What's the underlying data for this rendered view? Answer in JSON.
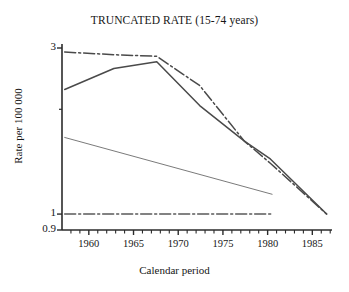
{
  "chart_data": {
    "type": "line",
    "title": "TRUNCATED RATE (15-74 years)",
    "xlabel": "Calendar period",
    "ylabel": "Rate per 100 000",
    "yscale": "log",
    "ylim": [
      0.9,
      3.0
    ],
    "xlim": [
      1957.0,
      1987.2
    ],
    "grid": false,
    "legend": "none",
    "ytick_labels": [
      "3",
      "1",
      "0.9"
    ],
    "ytick_values": [
      3,
      1,
      0.9
    ],
    "yminor_tick_values": [
      2
    ],
    "xtick_labels": [
      "1960",
      "1965",
      "1970",
      "1975",
      "1980",
      "1985"
    ],
    "xtick_values": [
      1960,
      1965,
      1970,
      1975,
      1980,
      1985
    ],
    "series": [
      {
        "name": "upper-dashdot-curve",
        "style": "dash-dot",
        "color": "#4a4a4a",
        "x": [
          1957.3,
          1962.8,
          1967.6,
          1972.4,
          1977.4,
          1980.3,
          1986.6
        ],
        "y": [
          2.92,
          2.87,
          2.84,
          2.34,
          1.62,
          1.4,
          1.0
        ]
      },
      {
        "name": "solid-peak-curve",
        "style": "solid",
        "color": "#4a4a4a",
        "x": [
          1957.3,
          1962.8,
          1967.6,
          1972.4,
          1977.4,
          1980.3,
          1986.6
        ],
        "y": [
          2.28,
          2.62,
          2.74,
          2.05,
          1.62,
          1.44,
          1.0
        ]
      },
      {
        "name": "thin-declining-line",
        "style": "thin-solid",
        "color": "#6b6b6b",
        "x": [
          1957.3,
          1980.5
        ],
        "y": [
          1.66,
          1.14
        ]
      },
      {
        "name": "baseline-dashdot",
        "style": "dash-dot",
        "color": "#5a5a5a",
        "x": [
          1957.3,
          1980.4
        ],
        "y": [
          1.0,
          1.0
        ]
      }
    ]
  },
  "axes": {
    "axis_color": "#2b2b2b"
  }
}
